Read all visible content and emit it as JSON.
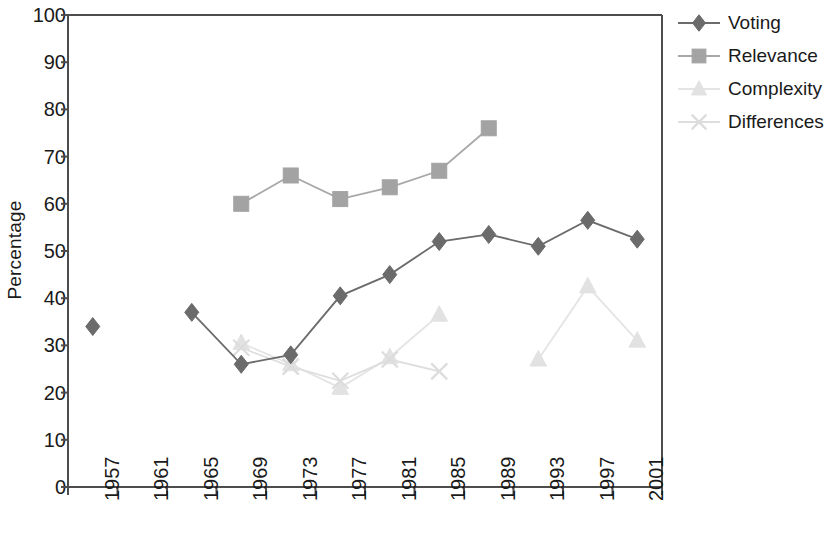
{
  "chart_data": {
    "type": "line",
    "title": "",
    "subtitle": "",
    "xlabel": "",
    "ylabel": "Percentage",
    "categories": [
      "1957",
      "1961",
      "1965",
      "1969",
      "1973",
      "1977",
      "1981",
      "1985",
      "1989",
      "1993",
      "1997",
      "2001"
    ],
    "ylim": [
      0,
      100
    ],
    "yticks": [
      0,
      10,
      20,
      30,
      40,
      50,
      60,
      70,
      80,
      90,
      100
    ],
    "ytick_labels": [
      "0",
      "10",
      "20",
      "30",
      "40",
      "50",
      "60",
      "70",
      "80",
      "90",
      "100"
    ],
    "grid": false,
    "legend_position": "right",
    "series": [
      {
        "name": "Voting",
        "marker": "diamond",
        "color": "#6b6b6b",
        "line_color": "#6b6b6b",
        "values": [
          34,
          null,
          37,
          26,
          28,
          40.5,
          45,
          52,
          53.5,
          51,
          56.5,
          52.5
        ]
      },
      {
        "name": "Relevance",
        "marker": "square",
        "color": "#a3a3a3",
        "line_color": "#a8a8a8",
        "values": [
          null,
          null,
          null,
          60,
          66,
          61,
          63.5,
          67,
          76,
          null,
          null,
          null
        ]
      },
      {
        "name": "Complexity",
        "marker": "triangle",
        "color": "#e2e2e2",
        "line_color": "#e4e4e4",
        "values": [
          null,
          null,
          null,
          30.5,
          26,
          21,
          27.5,
          36.5,
          null,
          27,
          42.5,
          31
        ]
      },
      {
        "name": "Differences",
        "marker": "x",
        "color": "#dcdcdc",
        "line_color": "#dedede",
        "values": [
          null,
          null,
          null,
          29.5,
          25.5,
          22.5,
          27,
          24.5,
          null,
          null,
          null,
          null
        ]
      }
    ]
  },
  "legend": {
    "items": [
      {
        "label": "Voting"
      },
      {
        "label": "Relevance"
      },
      {
        "label": "Complexity"
      },
      {
        "label": "Differences"
      }
    ]
  },
  "axis": {
    "y_title": "Percentage"
  }
}
